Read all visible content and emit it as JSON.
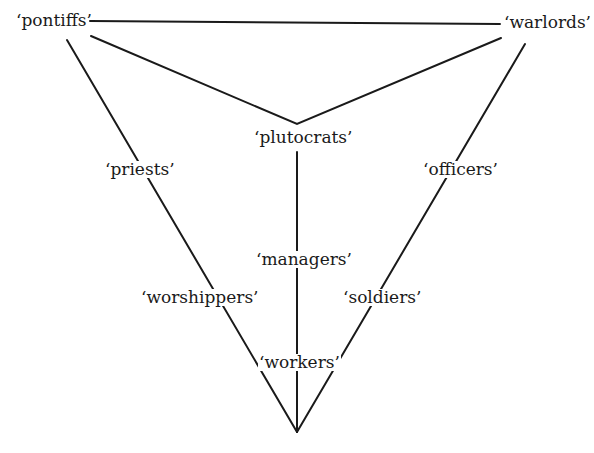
{
  "diagram": {
    "type": "triangle-hierarchy",
    "line_color": "#1a1a1a",
    "nodes": {
      "pontiffs": "‘pontiffs’",
      "warlords": "‘warlords’",
      "plutocrats": "‘plutocrats’",
      "priests": "‘priests’",
      "officers": "‘officers’",
      "managers": "‘managers’",
      "worshippers": "‘worshippers’",
      "soldiers": "‘soldiers’",
      "workers": "‘workers’"
    },
    "edges": [
      {
        "from": "pontiffs",
        "to": "warlords"
      },
      {
        "from": "pontiffs",
        "to": "plutocrats"
      },
      {
        "from": "warlords",
        "to": "plutocrats"
      },
      {
        "from": "pontiffs",
        "to": "apex",
        "via": [
          "priests",
          "worshippers"
        ]
      },
      {
        "from": "warlords",
        "to": "apex",
        "via": [
          "officers",
          "soldiers"
        ]
      },
      {
        "from": "plutocrats",
        "to": "apex",
        "via": [
          "managers",
          "workers"
        ]
      }
    ]
  }
}
